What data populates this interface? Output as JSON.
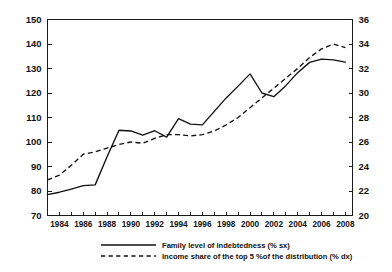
{
  "chart_data": {
    "type": "line",
    "title": "",
    "subtitle": "",
    "xlabel": "",
    "ylabel": "",
    "grid": false,
    "legend_position": "bottom",
    "x": [
      1983,
      1984,
      1985,
      1986,
      1987,
      1988,
      1989,
      1990,
      1991,
      1992,
      1993,
      1994,
      1995,
      1996,
      1997,
      1998,
      1999,
      2000,
      2001,
      2002,
      2003,
      2004,
      2005,
      2006,
      2007,
      2008
    ],
    "x_tick_labels": [
      "1984",
      "1986",
      "1988",
      "1990",
      "1992",
      "1994",
      "1996",
      "1998",
      "2000",
      "2002",
      "2004",
      "2006",
      "2008"
    ],
    "x_tick_values": [
      1984,
      1986,
      1988,
      1990,
      1992,
      1994,
      1996,
      1998,
      2000,
      2002,
      2004,
      2006,
      2008
    ],
    "xlim": [
      1983,
      2008.6
    ],
    "left_axis": {
      "label": "",
      "ylim": [
        70,
        150
      ],
      "ticks": [
        70,
        80,
        90,
        100,
        110,
        120,
        130,
        140,
        150
      ],
      "tick_labels": [
        "70",
        "80",
        "90",
        "100",
        "110",
        "120",
        "130",
        "140",
        "150"
      ]
    },
    "right_axis": {
      "label": "",
      "ylim": [
        20,
        36
      ],
      "ticks": [
        20,
        22,
        24,
        26,
        28,
        30,
        32,
        34,
        36
      ],
      "tick_labels": [
        "20",
        "22",
        "24",
        "26",
        "28",
        "30",
        "32",
        "34",
        "36"
      ]
    },
    "series": [
      {
        "name": "Family level of indebtedness (% sx)",
        "style": "solid",
        "axis": "left",
        "color": "#111111",
        "values": [
          78.5,
          79.5,
          80.8,
          82.2,
          82.5,
          94.0,
          104.8,
          104.5,
          102.8,
          104.6,
          102.0,
          109.5,
          107.3,
          107.0,
          112.5,
          118.0,
          122.8,
          127.8,
          120.0,
          118.5,
          123.0,
          128.3,
          132.5,
          133.8,
          133.5,
          132.6
        ]
      },
      {
        "name": "Income share of the top 5 %of the distribution (% dx)",
        "style": "dashed",
        "axis": "right",
        "color": "#111111",
        "values": [
          22.9,
          23.3,
          24.1,
          25.0,
          25.2,
          25.5,
          25.8,
          26.0,
          25.9,
          26.3,
          26.6,
          26.6,
          26.5,
          26.6,
          26.9,
          27.4,
          28.0,
          28.8,
          29.6,
          30.4,
          31.2,
          32.0,
          32.9,
          33.6,
          34.0,
          33.7
        ]
      }
    ],
    "legend": [
      {
        "label": "Family level of indebtedness (% sx)",
        "style": "solid"
      },
      {
        "label": "Income share of the top 5 %of the distribution (% dx)",
        "style": "dashed"
      }
    ]
  }
}
